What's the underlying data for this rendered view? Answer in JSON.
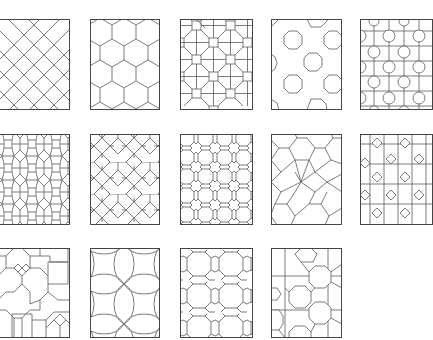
{
  "figure": {
    "background": "#ffffff",
    "line_color": "#5a5a5a",
    "rows": 3,
    "columns": 5,
    "panels": [
      {
        "id": 1,
        "row": 1,
        "col": 1,
        "pattern": "square-diagonal-grid",
        "x": -2,
        "y": 19,
        "w": 72,
        "h": 91
      },
      {
        "id": 2,
        "row": 1,
        "col": 2,
        "pattern": "hexagonal",
        "x": 90,
        "y": 19,
        "w": 70,
        "h": 91
      },
      {
        "id": 3,
        "row": 1,
        "col": 3,
        "pattern": "octagon-square",
        "x": 180,
        "y": 19,
        "w": 73,
        "h": 91
      },
      {
        "id": 4,
        "row": 1,
        "col": 4,
        "pattern": "sparse-octagons",
        "x": 271,
        "y": 19,
        "w": 71,
        "h": 91
      },
      {
        "id": 5,
        "row": 1,
        "col": 5,
        "pattern": "octagon-cross-grid",
        "x": 360,
        "y": 19,
        "w": 73,
        "h": 91
      },
      {
        "id": 6,
        "row": 2,
        "col": 1,
        "pattern": "hexagon-square-lattice",
        "x": -2,
        "y": 134,
        "w": 72,
        "h": 91
      },
      {
        "id": 7,
        "row": 2,
        "col": 2,
        "pattern": "cross-star-interlace",
        "x": 90,
        "y": 134,
        "w": 70,
        "h": 91
      },
      {
        "id": 8,
        "row": 2,
        "col": 3,
        "pattern": "circle-octagon-lattice",
        "x": 180,
        "y": 134,
        "w": 73,
        "h": 91
      },
      {
        "id": 9,
        "row": 2,
        "col": 4,
        "pattern": "six-point-star-hexagons",
        "x": 271,
        "y": 134,
        "w": 71,
        "h": 91
      },
      {
        "id": 10,
        "row": 2,
        "col": 5,
        "pattern": "diamond-cross-grid",
        "x": 360,
        "y": 134,
        "w": 73,
        "h": 91
      },
      {
        "id": 11,
        "row": 3,
        "col": 1,
        "pattern": "octagon-square-mixed",
        "x": -2,
        "y": 248,
        "w": 72,
        "h": 90
      },
      {
        "id": 12,
        "row": 3,
        "col": 2,
        "pattern": "scalloped-quatrefoil",
        "x": 90,
        "y": 248,
        "w": 70,
        "h": 90
      },
      {
        "id": 13,
        "row": 3,
        "col": 3,
        "pattern": "octagon-cross-interlace",
        "x": 180,
        "y": 248,
        "w": 73,
        "h": 90
      },
      {
        "id": 14,
        "row": 3,
        "col": 4,
        "pattern": "octagon-cross-large",
        "x": 271,
        "y": 248,
        "w": 71,
        "h": 90
      }
    ]
  }
}
